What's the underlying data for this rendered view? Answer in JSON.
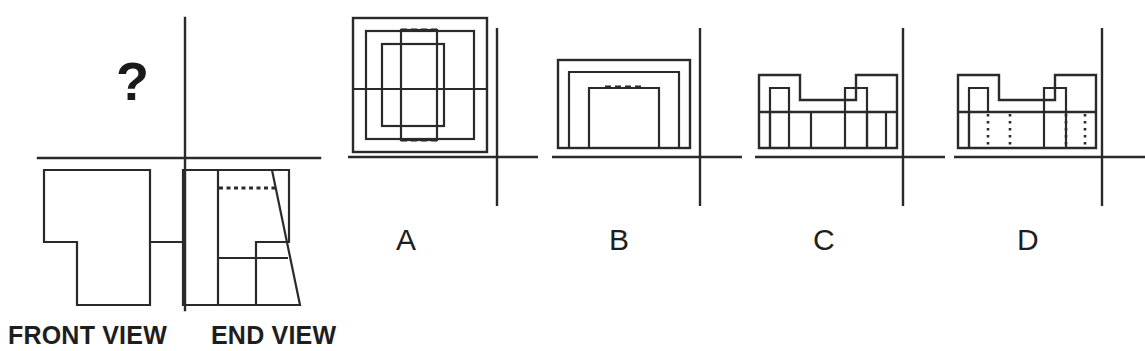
{
  "canvas": {
    "width": 1145,
    "height": 351,
    "background": "#ffffff"
  },
  "style": {
    "line_color": "#2a2a2a",
    "text_color": "#1e1e1e",
    "axis_color": "#2a2a2a",
    "outline_width": 2.2,
    "axis_width": 2.4,
    "hidden_width": 2.6
  },
  "question": {
    "glyph": "?",
    "x": 116,
    "y": 100,
    "meaning": "missing-plan-view"
  },
  "given_views": {
    "axis": {
      "vertical": {
        "x": 185,
        "y1": 18,
        "y2": 310
      },
      "horizontal": {
        "y": 158,
        "x1": 38,
        "x2": 320
      }
    },
    "front_view": {
      "label": "FRONT VIEW",
      "label_x": 8,
      "label_y": 344,
      "outline": "M 44 170 L 150 170 L 150 242 L 183 242 L 183 170 L 289 170 L 289 242 L 256 242 L 256 305 L 183 305 L 183 242 L 150 242 L 150 305 L 77 305 L 77 242 L 44 242 Z",
      "description": "U-shaped bracket with central raised boss and two wide feet"
    },
    "end_view": {
      "label": "END VIEW",
      "label_x": 211,
      "label_y": 344,
      "outline": "M 218 170 L 272 170 L 300 305 L 218 305 Z",
      "hidden_line": {
        "x1": 219,
        "y1": 188,
        "x2": 276,
        "y2": 188
      },
      "solid_line": {
        "x1": 219,
        "y1": 258,
        "x2": 288,
        "y2": 258
      },
      "description": "Trapezoid, vertical left edge, tapered right edge, hidden line near top, visible line lower"
    }
  },
  "options": [
    {
      "id": "A",
      "label": "A",
      "label_x": 396,
      "label_y": 250,
      "axis": {
        "vertical": {
          "x": 497,
          "y1": 28,
          "y2": 206
        },
        "horizontal": {
          "y": 157,
          "x1": 348,
          "x2": 538
        }
      },
      "outer_rect": {
        "x": 353,
        "y": 18,
        "w": 134,
        "h": 134
      },
      "mid_rect": {
        "x": 366,
        "y": 31,
        "w": 108,
        "h": 108
      },
      "inner_rect": {
        "x": 382,
        "y": 44,
        "w": 62,
        "h": 82
      },
      "tall_rect": {
        "x": 401,
        "y": 30,
        "w": 36,
        "h": 110
      },
      "hidden_top": {
        "x1": 401,
        "y1": 30,
        "x2": 437,
        "y2": 30
      },
      "hidden_bottom": {
        "x1": 401,
        "y1": 140,
        "x2": 437,
        "y2": 140
      },
      "crossing_line": {
        "y": 89,
        "x1": 353,
        "x2": 487
      },
      "description": "Nested squares with inner vertical rectangle and dashed hidden edges"
    },
    {
      "id": "B",
      "label": "B",
      "label_x": 609,
      "label_y": 250,
      "axis": {
        "vertical": {
          "x": 700,
          "y1": 28,
          "y2": 206
        },
        "horizontal": {
          "y": 157,
          "x1": 552,
          "x2": 742
        }
      },
      "outer_rect": {
        "x": 558,
        "y": 60,
        "w": 132,
        "h": 88
      },
      "mid_shape": "M 569 148 L 569 72 L 679 72 L 679 148",
      "inner_shape": "M 589 148 L 589 88 L 659 88 L 659 148",
      "hidden_top": {
        "x1": 605,
        "y1": 87,
        "x2": 645,
        "y2": 87
      },
      "description": "Nested rectangle and inverted-U outlines with dashed top segment"
    },
    {
      "id": "C",
      "label": "C",
      "label_x": 813,
      "label_y": 250,
      "axis": {
        "vertical": {
          "x": 903,
          "y1": 28,
          "y2": 206
        },
        "horizontal": {
          "y": 157,
          "x1": 755,
          "x2": 945
        }
      },
      "outline": "M 759 148 L 759 75 L 800 75 L 800 100 L 856 100 L 856 75 L 897 75 L 897 148 Z",
      "inner_verticals": [
        770,
        789,
        811,
        845,
        867,
        886
      ],
      "notch_step": "M 770 148 L 770 88 L 789 88 L 789 112 L 845 112 L 845 88 L 867 88 L 867 148",
      "cross_line": {
        "y": 112,
        "x1": 759,
        "x2": 897,
        "style": "solid"
      },
      "description": "Castellated block, two raised bosses, solid visible lines in lower body"
    },
    {
      "id": "D",
      "label": "D",
      "label_x": 1017,
      "label_y": 250,
      "axis": {
        "vertical": {
          "x": 1102,
          "y1": 28,
          "y2": 206
        },
        "horizontal": {
          "y": 157,
          "x1": 954,
          "x2": 1145
        }
      },
      "outline": "M 958 148 L 958 75 L 999 75 L 999 100 L 1055 100 L 1055 75 L 1096 75 L 1096 148 Z",
      "inner_verticals_solid": [
        969,
        1044
      ],
      "notch_step": "M 969 148 L 969 88 L 988 88 L 988 112 L 1044 112 L 1044 88 L 1066 88 L 1066 148",
      "cross_line": {
        "y": 112,
        "x1": 958,
        "x2": 1096,
        "style": "solid"
      },
      "hidden_verticals": [
        988,
        1010,
        1066,
        1085
      ],
      "description": "Castellated block identical to C but with dotted hidden vertical lines in lower body"
    }
  ]
}
